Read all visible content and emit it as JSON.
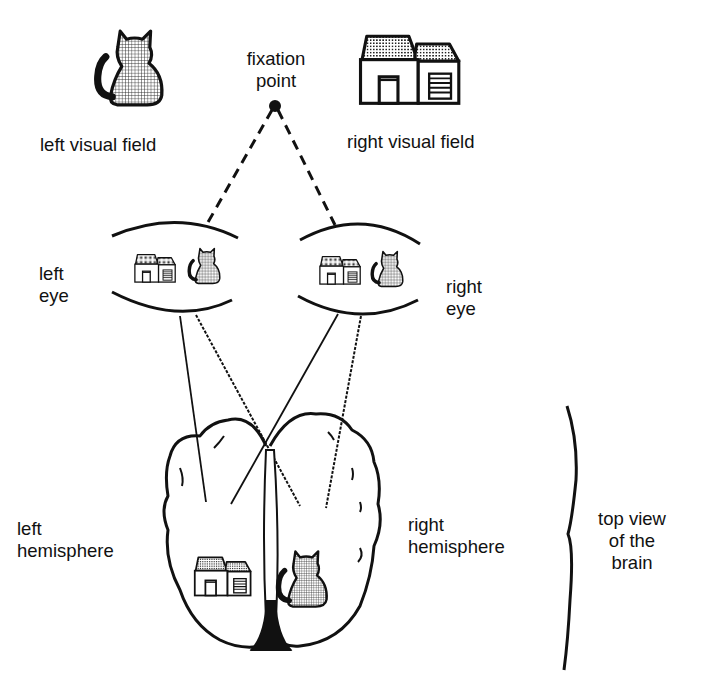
{
  "diagram": {
    "top": {
      "fixation_point_label_1": "fixation",
      "fixation_point_label_2": "point",
      "left_field_label": "left visual field",
      "right_field_label": "right visual field",
      "left_field_object": "cat",
      "right_field_object": "house"
    },
    "eyes": {
      "left_eye_label_1": "left",
      "left_eye_label_2": "eye",
      "right_eye_label_1": "right",
      "right_eye_label_2": "eye",
      "retinal_image_objects": [
        "house",
        "cat"
      ]
    },
    "brain": {
      "left_hemisphere_label_1": "left",
      "left_hemisphere_label_2": "hemisphere",
      "right_hemisphere_label_1": "right",
      "right_hemisphere_label_2": "hemisphere",
      "left_hemisphere_object": "house",
      "right_hemisphere_object": "cat",
      "brace_label_1": "top view",
      "brace_label_2": "of the",
      "brace_label_3": "brain"
    },
    "colors": {
      "ink": "#111111",
      "background": "#ffffff"
    }
  }
}
